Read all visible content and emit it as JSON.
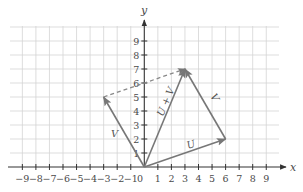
{
  "figure": {
    "axes": {
      "x_label": "x",
      "y_label": "y",
      "origin_label": "0",
      "x_ticks": [
        "-9",
        "-8",
        "-7",
        "-6",
        "-5",
        "-4",
        "-3",
        "-2",
        "-1",
        "1",
        "2",
        "3",
        "4",
        "5",
        "6",
        "7",
        "8",
        "9"
      ],
      "y_ticks": [
        "1",
        "2",
        "3",
        "4",
        "5",
        "6",
        "7",
        "8",
        "9"
      ],
      "x_range": [
        -9,
        9
      ],
      "y_range": [
        0,
        9
      ]
    },
    "vectors": [
      {
        "name": "U",
        "label": "U",
        "from": [
          0,
          0
        ],
        "to": [
          6,
          2
        ],
        "style": "solid"
      },
      {
        "name": "V",
        "label": "V",
        "from": [
          0,
          0
        ],
        "to": [
          -3,
          5
        ],
        "style": "solid"
      },
      {
        "name": "V-translated",
        "label": "V",
        "from": [
          6,
          2
        ],
        "to": [
          3,
          7
        ],
        "style": "solid"
      },
      {
        "name": "U-plus-V",
        "label": "U + V",
        "from": [
          0,
          0
        ],
        "to": [
          3,
          7
        ],
        "style": "solid"
      },
      {
        "name": "U-translated",
        "label": "",
        "from": [
          -3,
          5
        ],
        "to": [
          3,
          7
        ],
        "style": "dashed"
      }
    ],
    "colors": {
      "vector": "#777777",
      "grid": "#d4d4d4",
      "axis": "#333333"
    }
  }
}
